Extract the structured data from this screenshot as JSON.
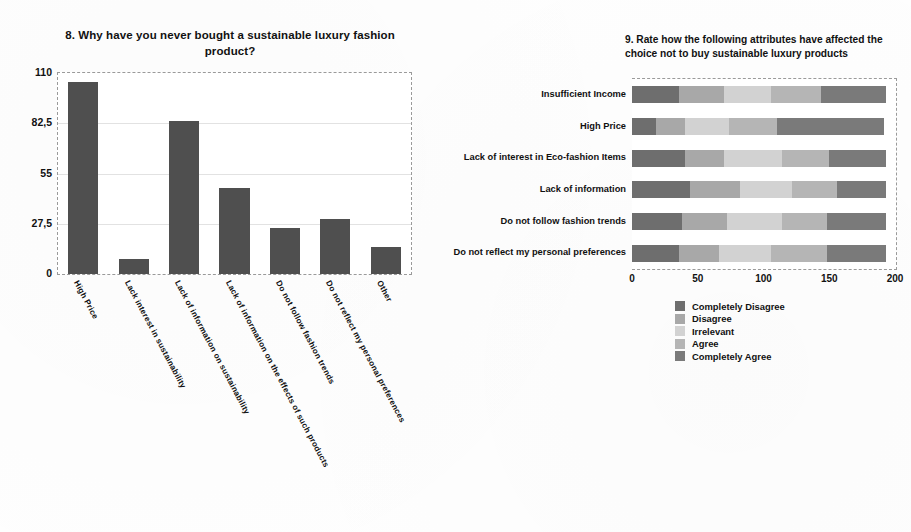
{
  "chart_data": [
    {
      "id": "q8",
      "type": "bar",
      "title": "8. Why have you never bought a sustainable luxury fashion product?",
      "xlabel": "",
      "ylabel": "",
      "ylim": [
        0,
        110
      ],
      "yticks": [
        "0",
        "27,5",
        "55",
        "82,5",
        "110"
      ],
      "ytick_values": [
        0,
        27.5,
        55,
        82.5,
        110
      ],
      "grid": true,
      "legend": "none",
      "bar_color": "#4f4f4f",
      "categories": [
        "High Price",
        "Lack  interest in sustainability",
        "Lack of information on sustainability",
        "Lack of information on the effects of such products",
        "Do not follow fashion trends",
        "Do not reflect my personal preferences",
        "Other"
      ],
      "values": [
        105,
        8,
        84,
        47,
        25,
        30,
        15
      ]
    },
    {
      "id": "q9",
      "type": "bar",
      "orientation": "horizontal",
      "stacked": true,
      "title": "9. Rate how the following attributes have affected the choice not to buy sustainable luxury products",
      "xlabel": "",
      "ylabel": "",
      "xlim": [
        0,
        200
      ],
      "xticks": [
        "0",
        "50",
        "100",
        "150",
        "200"
      ],
      "xtick_values": [
        0,
        50,
        100,
        150,
        200
      ],
      "grid": false,
      "legend_position": "bottom-left",
      "categories": [
        "Insufficient Income",
        "High Price",
        "Lack of interest in Eco-fashion Items",
        "Lack of information",
        "Do not follow fashion trends",
        "Do not reflect my personal preferences"
      ],
      "series": [
        {
          "name": "Completely Disagree",
          "color": "#6e6e6e",
          "values": [
            36,
            18,
            40,
            44,
            38,
            36
          ]
        },
        {
          "name": "Disagree",
          "color": "#a8a8a8",
          "values": [
            34,
            22,
            30,
            38,
            34,
            30
          ]
        },
        {
          "name": "Irrelevant",
          "color": "#d2d2d2",
          "values": [
            36,
            34,
            44,
            40,
            42,
            40
          ]
        },
        {
          "name": "Agree",
          "color": "#b5b5b5",
          "values": [
            38,
            36,
            36,
            34,
            34,
            42
          ]
        },
        {
          "name": "Completely Agree",
          "color": "#7a7a7a",
          "values": [
            49,
            82,
            43,
            37,
            45,
            45
          ]
        }
      ]
    }
  ]
}
